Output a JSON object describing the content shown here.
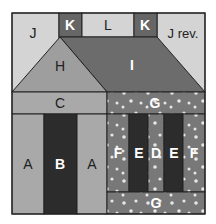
{
  "diagram": {
    "colors": {
      "light": "#d4d4d4",
      "medium": "#a9a9a9",
      "roof_left": "#9e9e9e",
      "dark_roof": "#6c6c6c",
      "chimney": "#666666",
      "print": "#787878",
      "very_dark": "#2c2c2c",
      "dots": "#e6e6e6",
      "outline": "#222222"
    },
    "pieces": {
      "J": "J",
      "K1": "K",
      "L": "L",
      "K2": "K",
      "J_rev": "J rev.",
      "H": "H",
      "I": "I",
      "C": "C",
      "G_top": "G",
      "A1": "A",
      "B": "B",
      "A2": "A",
      "F1": "F",
      "E1": "E",
      "D": "D",
      "E2": "E",
      "F2": "F",
      "G_bottom": "G"
    }
  }
}
